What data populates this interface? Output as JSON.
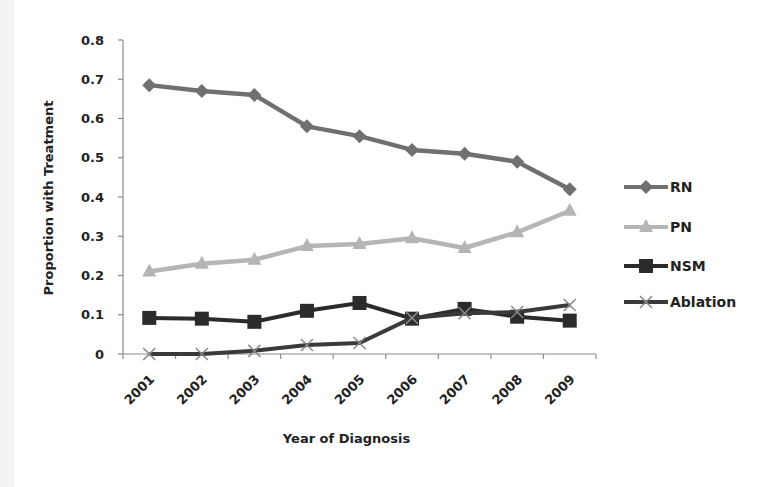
{
  "chart_data": {
    "type": "line",
    "title": "",
    "xlabel": "Year of Diagnosis",
    "ylabel": "Proportion with Treatment",
    "ylim": [
      0,
      0.8
    ],
    "yticks": [
      "0",
      "0.1",
      "0.2",
      "0.3",
      "0.4",
      "0.5",
      "0.6",
      "0.7",
      "0.8"
    ],
    "categories": [
      "2001",
      "2002",
      "2003",
      "2004",
      "2005",
      "2006",
      "2007",
      "2008",
      "2009"
    ],
    "grid": false,
    "legend_position": "right",
    "series": [
      {
        "name": "RN",
        "marker": "diamond",
        "color": "#707070",
        "values": [
          0.685,
          0.67,
          0.66,
          0.58,
          0.555,
          0.52,
          0.51,
          0.49,
          0.42
        ]
      },
      {
        "name": "PN",
        "marker": "triangle",
        "color": "#b5b5b5",
        "values": [
          0.21,
          0.23,
          0.24,
          0.275,
          0.28,
          0.295,
          0.27,
          0.31,
          0.365
        ]
      },
      {
        "name": "NSM",
        "marker": "square",
        "color": "#2b2b2b",
        "values": [
          0.092,
          0.09,
          0.082,
          0.11,
          0.13,
          0.09,
          0.115,
          0.095,
          0.085
        ]
      },
      {
        "name": "Ablation",
        "marker": "x",
        "color": "#3a3a3a",
        "values": [
          0.0,
          0.0,
          0.008,
          0.023,
          0.028,
          0.092,
          0.104,
          0.107,
          0.125
        ]
      }
    ]
  }
}
